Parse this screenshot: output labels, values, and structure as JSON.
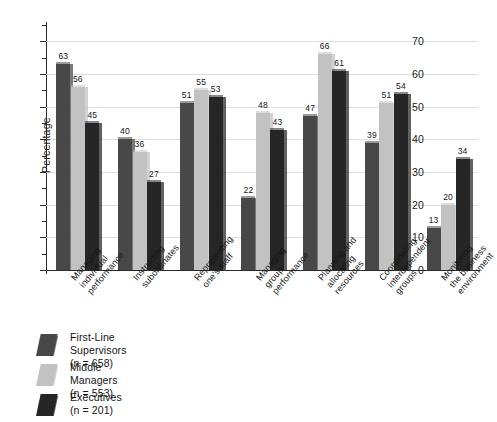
{
  "chart_data": {
    "type": "bar",
    "title": "",
    "subtitle": "",
    "xlabel": "",
    "ylabel": "Percentage",
    "ylim": [
      0,
      75
    ],
    "yticks": [
      0,
      10,
      20,
      30,
      40,
      50,
      60,
      70
    ],
    "ytick_labels": [
      "0",
      "10",
      "20",
      "30",
      "40",
      "50",
      "60",
      "70"
    ],
    "grid": true,
    "legend_position": "below-left",
    "categories": [
      "Managing individual performance",
      "Instructing subordinates",
      "Representing one's staff",
      "Managing group performance",
      "Planning and allocating resources",
      "Coordinating interdependent groups",
      "Monitoring the business environment"
    ],
    "category_lines": [
      [
        "Managing",
        "individual",
        "performance"
      ],
      [
        "Instructing",
        "subordinates"
      ],
      [
        "Representing",
        "one's staff"
      ],
      [
        "Managing",
        "group",
        "performance"
      ],
      [
        "Planning and",
        "allocating",
        "resources"
      ],
      [
        "Coordinating",
        "interdependent",
        "groups"
      ],
      [
        "Monitoring",
        "the business",
        "environment"
      ]
    ],
    "series": [
      {
        "name": "First-Line Supervisors",
        "n_label": "(n = 658)",
        "color": "#484848",
        "values": [
          63,
          40,
          51,
          22,
          47,
          39,
          13
        ]
      },
      {
        "name": "Middle Managers",
        "n_label": "(n = 553)",
        "color": "#c2c2c2",
        "values": [
          56,
          36,
          55,
          48,
          66,
          51,
          20
        ]
      },
      {
        "name": "Executives",
        "n_label": "(n = 201)",
        "color": "#262626",
        "values": [
          45,
          27,
          53,
          43,
          61,
          54,
          34
        ]
      }
    ]
  },
  "colors": {
    "background": "#ffffff",
    "axis": "#2b2b2b",
    "grid": "#dedede",
    "text": "#151515"
  }
}
